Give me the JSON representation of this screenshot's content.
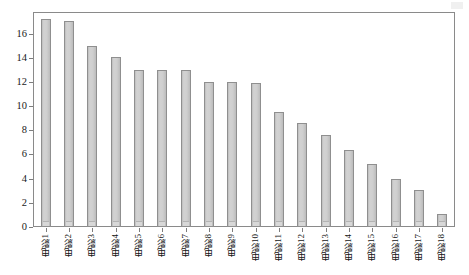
{
  "chart_data": {
    "type": "bar",
    "title": "",
    "subtitle": "",
    "xlabel": "",
    "ylabel": "",
    "categories": [
      "电影1",
      "电影2",
      "电影3",
      "电影4",
      "电影5",
      "电影6",
      "电影7",
      "电影8",
      "电影9",
      "电影10",
      "电影11",
      "电影12",
      "电影13",
      "电影14",
      "电影15",
      "电影16",
      "电影17",
      "电影18"
    ],
    "values": [
      17.2,
      17.0,
      15.0,
      14.1,
      13.0,
      13.0,
      13.0,
      12.0,
      12.0,
      11.9,
      9.5,
      8.6,
      7.6,
      6.4,
      5.2,
      4.0,
      3.1,
      1.1
    ],
    "ylim": [
      0,
      17.7
    ],
    "y_ticks": [
      0,
      2,
      4,
      6,
      8,
      10,
      12,
      14,
      16
    ],
    "y_tick_labels": [
      "0",
      "2",
      "4",
      "6",
      "8",
      "10",
      "12",
      "14",
      "16"
    ],
    "grid": false,
    "legend": null,
    "bar_color": "#cfcfcf",
    "bar_border_color": "#8f8f8f",
    "axis_color": "#8a8a8a",
    "background": "#ffffff"
  }
}
